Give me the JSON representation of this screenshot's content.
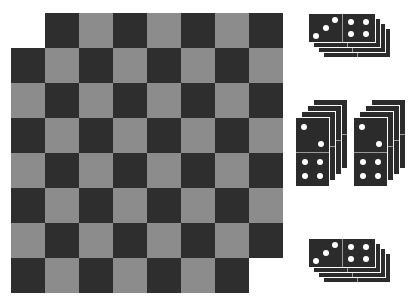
{
  "colors": {
    "dark_square": "#2e2e2e",
    "light_square": "#8c8c8c",
    "domino": "#2b2b2b",
    "pip": "#ffffff",
    "background": "#ffffff"
  },
  "board": {
    "rows": 8,
    "cols": 8,
    "origin_x": 11,
    "origin_y": 13,
    "cell_w": 34,
    "cell_h": 35,
    "top_left_is_light": true,
    "missing_cells": [
      [
        0,
        0
      ],
      [
        7,
        7
      ]
    ]
  },
  "domino_stacks": [
    {
      "name": "stack-top",
      "orientation": "horizontal",
      "x": 308,
      "y": 13,
      "w": 68,
      "h": 30,
      "count": 4,
      "dx": 5,
      "dy": 5,
      "pips": [
        3,
        4
      ]
    },
    {
      "name": "stack-middle-left",
      "orientation": "vertical",
      "x": 295,
      "y": 117,
      "w": 35,
      "h": 70,
      "count": 4,
      "dx": 6,
      "dy": -6,
      "pips": [
        2,
        4
      ]
    },
    {
      "name": "stack-middle-right",
      "orientation": "vertical",
      "x": 353,
      "y": 117,
      "w": 35,
      "h": 70,
      "count": 4,
      "dx": 6,
      "dy": -6,
      "pips": [
        2,
        4
      ]
    },
    {
      "name": "stack-bottom",
      "orientation": "horizontal",
      "x": 308,
      "y": 238,
      "w": 68,
      "h": 30,
      "count": 4,
      "dx": 5,
      "dy": 5,
      "pips": [
        3,
        4
      ]
    }
  ]
}
